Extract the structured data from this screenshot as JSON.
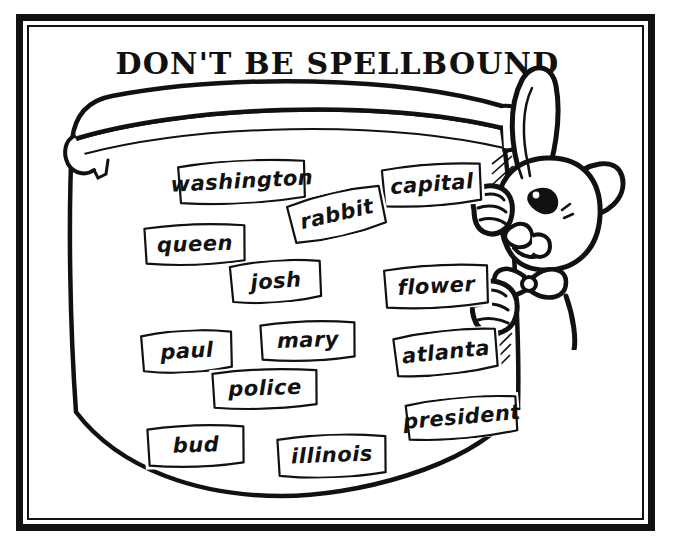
{
  "page": {
    "title": "DON'T BE SPELLBOUND",
    "background_color": "#ffffff",
    "ink_color": "#111111",
    "frame_style": "double-rule-black-border"
  },
  "artwork": {
    "scroll": {
      "name": "unrolled-paper-scroll",
      "description": "A large hand-drawn unrolled scroll / banner with a rolled bar across the top and a curved bottom edge"
    },
    "character": {
      "name": "cartoon-rabbit",
      "description": "Cartoon rabbit with two long ears, one upright and one flopped, wearing a bow tie, peeking from behind the right edge of the scroll and gripping it with both paws"
    }
  },
  "word_cards": [
    {
      "id": "washington",
      "label": "washington",
      "left": 176,
      "top": 160,
      "width": 132,
      "height": 44,
      "rotate": -3,
      "font_size": 21
    },
    {
      "id": "capital",
      "label": "capital",
      "left": 380,
      "top": 163,
      "width": 104,
      "height": 44,
      "rotate": -4,
      "font_size": 21
    },
    {
      "id": "rabbit",
      "label": "rabbit",
      "left": 287,
      "top": 192,
      "width": 100,
      "height": 45,
      "rotate": -13,
      "font_size": 21
    },
    {
      "id": "queen",
      "label": "queen",
      "left": 142,
      "top": 223,
      "width": 106,
      "height": 43,
      "rotate": -2,
      "font_size": 21
    },
    {
      "id": "josh",
      "label": "josh",
      "left": 228,
      "top": 260,
      "width": 96,
      "height": 43,
      "rotate": -4,
      "font_size": 21
    },
    {
      "id": "flower",
      "label": "flower",
      "left": 382,
      "top": 264,
      "width": 109,
      "height": 45,
      "rotate": -3,
      "font_size": 21
    },
    {
      "id": "paul",
      "label": "paul",
      "left": 139,
      "top": 330,
      "width": 96,
      "height": 43,
      "rotate": -3,
      "font_size": 21
    },
    {
      "id": "mary",
      "label": "mary",
      "left": 258,
      "top": 320,
      "width": 100,
      "height": 42,
      "rotate": -2,
      "font_size": 21
    },
    {
      "id": "atlanta",
      "label": "atlanta",
      "left": 392,
      "top": 330,
      "width": 108,
      "height": 45,
      "rotate": -6,
      "font_size": 21
    },
    {
      "id": "police",
      "label": "police",
      "left": 210,
      "top": 368,
      "width": 110,
      "height": 42,
      "rotate": -2,
      "font_size": 21
    },
    {
      "id": "president",
      "label": "president",
      "left": 404,
      "top": 397,
      "width": 116,
      "height": 42,
      "rotate": -5,
      "font_size": 21
    },
    {
      "id": "bud",
      "label": "bud",
      "left": 145,
      "top": 424,
      "width": 102,
      "height": 44,
      "rotate": -2,
      "font_size": 21
    },
    {
      "id": "illinois",
      "label": "illinois",
      "left": 275,
      "top": 434,
      "width": 114,
      "height": 44,
      "rotate": -2,
      "font_size": 21
    }
  ]
}
